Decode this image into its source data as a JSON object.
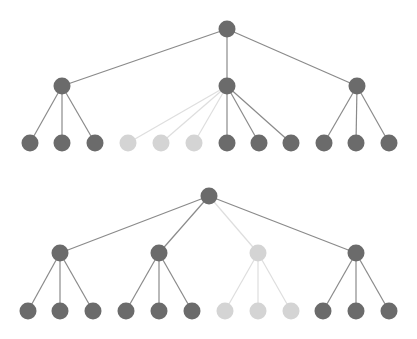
{
  "colors": {
    "background": "#ffffff",
    "node_active": "#6b6b6b",
    "node_inactive": "#d4d4d4",
    "edge_active": "#8a8a8a",
    "edge_inactive": "#dedede"
  },
  "node_radius": 8.5,
  "trees": [
    {
      "name": "tree-top",
      "nodes": [
        {
          "id": "t_root",
          "x": 227,
          "y": 29,
          "active": true
        },
        {
          "id": "t_a",
          "x": 62,
          "y": 86,
          "active": true
        },
        {
          "id": "t_b",
          "x": 227,
          "y": 86,
          "active": true
        },
        {
          "id": "t_c",
          "x": 357,
          "y": 86,
          "active": true
        },
        {
          "id": "t_a1",
          "x": 30,
          "y": 143,
          "active": true
        },
        {
          "id": "t_a2",
          "x": 62,
          "y": 143,
          "active": true
        },
        {
          "id": "t_a3",
          "x": 95,
          "y": 143,
          "active": true
        },
        {
          "id": "t_b1",
          "x": 128,
          "y": 143,
          "active": false
        },
        {
          "id": "t_b2",
          "x": 161,
          "y": 143,
          "active": false
        },
        {
          "id": "t_b3",
          "x": 194,
          "y": 143,
          "active": false
        },
        {
          "id": "t_b4",
          "x": 227,
          "y": 143,
          "active": true
        },
        {
          "id": "t_b5",
          "x": 259,
          "y": 143,
          "active": true
        },
        {
          "id": "t_b6",
          "x": 291,
          "y": 143,
          "active": true
        },
        {
          "id": "t_c1",
          "x": 324,
          "y": 143,
          "active": true
        },
        {
          "id": "t_c2",
          "x": 356,
          "y": 143,
          "active": true
        },
        {
          "id": "t_c3",
          "x": 389,
          "y": 143,
          "active": true
        }
      ],
      "edges": [
        {
          "from": "t_root",
          "to": "t_a",
          "active": true
        },
        {
          "from": "t_root",
          "to": "t_b",
          "active": true
        },
        {
          "from": "t_root",
          "to": "t_c",
          "active": true
        },
        {
          "from": "t_a",
          "to": "t_a1",
          "active": true
        },
        {
          "from": "t_a",
          "to": "t_a2",
          "active": true
        },
        {
          "from": "t_a",
          "to": "t_a3",
          "active": true
        },
        {
          "from": "t_b",
          "to": "t_b1",
          "active": false
        },
        {
          "from": "t_b",
          "to": "t_b2",
          "active": false
        },
        {
          "from": "t_b",
          "to": "t_b3",
          "active": false
        },
        {
          "from": "t_b",
          "to": "t_b4",
          "active": true
        },
        {
          "from": "t_b",
          "to": "t_b5",
          "active": true
        },
        {
          "from": "t_b",
          "to": "t_b6",
          "active": true
        },
        {
          "from": "t_c",
          "to": "t_c1",
          "active": true
        },
        {
          "from": "t_c",
          "to": "t_c2",
          "active": true
        },
        {
          "from": "t_c",
          "to": "t_c3",
          "active": true
        }
      ]
    },
    {
      "name": "tree-bottom",
      "nodes": [
        {
          "id": "b_root",
          "x": 209,
          "y": 196,
          "active": true
        },
        {
          "id": "b_a",
          "x": 60,
          "y": 253,
          "active": true
        },
        {
          "id": "b_b",
          "x": 159,
          "y": 253,
          "active": true
        },
        {
          "id": "b_c",
          "x": 258,
          "y": 253,
          "active": false
        },
        {
          "id": "b_d",
          "x": 356,
          "y": 253,
          "active": true
        },
        {
          "id": "b_a1",
          "x": 28,
          "y": 311,
          "active": true
        },
        {
          "id": "b_a2",
          "x": 60,
          "y": 311,
          "active": true
        },
        {
          "id": "b_a3",
          "x": 93,
          "y": 311,
          "active": true
        },
        {
          "id": "b_b1",
          "x": 126,
          "y": 311,
          "active": true
        },
        {
          "id": "b_b2",
          "x": 159,
          "y": 311,
          "active": true
        },
        {
          "id": "b_b3",
          "x": 192,
          "y": 311,
          "active": true
        },
        {
          "id": "b_c1",
          "x": 225,
          "y": 311,
          "active": false
        },
        {
          "id": "b_c2",
          "x": 258,
          "y": 311,
          "active": false
        },
        {
          "id": "b_c3",
          "x": 291,
          "y": 311,
          "active": false
        },
        {
          "id": "b_d1",
          "x": 323,
          "y": 311,
          "active": true
        },
        {
          "id": "b_d2",
          "x": 356,
          "y": 311,
          "active": true
        },
        {
          "id": "b_d3",
          "x": 389,
          "y": 311,
          "active": true
        }
      ],
      "edges": [
        {
          "from": "b_root",
          "to": "b_a",
          "active": true
        },
        {
          "from": "b_root",
          "to": "b_b",
          "active": true
        },
        {
          "from": "b_root",
          "to": "b_c",
          "active": false
        },
        {
          "from": "b_root",
          "to": "b_d",
          "active": true
        },
        {
          "from": "b_a",
          "to": "b_a1",
          "active": true
        },
        {
          "from": "b_a",
          "to": "b_a2",
          "active": true
        },
        {
          "from": "b_a",
          "to": "b_a3",
          "active": true
        },
        {
          "from": "b_b",
          "to": "b_b1",
          "active": true
        },
        {
          "from": "b_b",
          "to": "b_b2",
          "active": true
        },
        {
          "from": "b_b",
          "to": "b_b3",
          "active": true
        },
        {
          "from": "b_c",
          "to": "b_c1",
          "active": false
        },
        {
          "from": "b_c",
          "to": "b_c2",
          "active": false
        },
        {
          "from": "b_c",
          "to": "b_c3",
          "active": false
        },
        {
          "from": "b_d",
          "to": "b_d1",
          "active": true
        },
        {
          "from": "b_d",
          "to": "b_d2",
          "active": true
        },
        {
          "from": "b_d",
          "to": "b_d3",
          "active": true
        }
      ]
    }
  ]
}
